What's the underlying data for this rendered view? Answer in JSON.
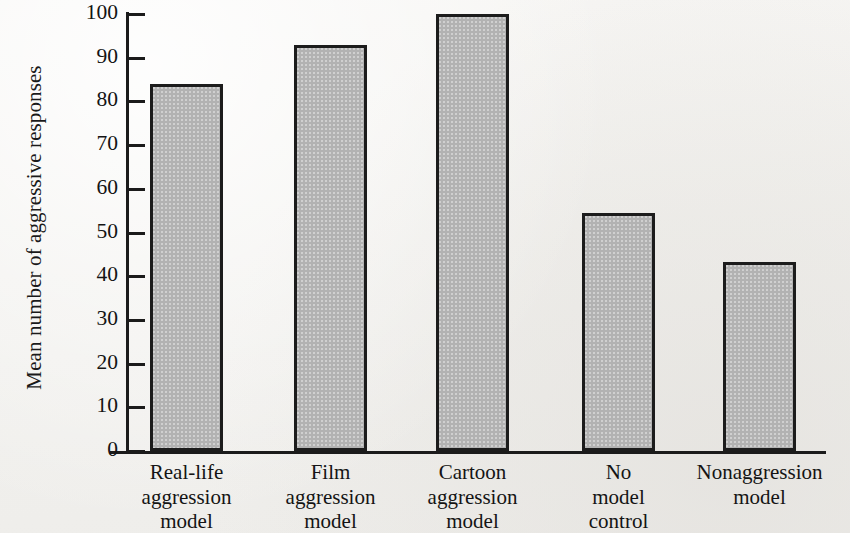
{
  "chart_data": {
    "type": "bar",
    "title": "",
    "xlabel": "",
    "ylabel": "Mean number of aggressive responses",
    "ylim": [
      0,
      100
    ],
    "yticks": [
      0,
      10,
      20,
      30,
      40,
      50,
      60,
      70,
      80,
      90,
      100
    ],
    "ytick_labels": [
      "0",
      "10",
      "20",
      "30",
      "40",
      "50",
      "60",
      "70",
      "80",
      "90",
      "100"
    ],
    "grid": false,
    "legend": false,
    "bar_color": "#b2b2b2",
    "bar_edge_color": "#1c1c1c",
    "axis_color": "#1b1b1b",
    "background_color": "#f4f3f1",
    "categories": [
      "Real-life aggression model",
      "Film aggression model",
      "Cartoon aggression model",
      "No model control",
      "Nonaggression model"
    ],
    "category_lines": [
      [
        "Real-life",
        "aggression",
        "model"
      ],
      [
        "Film",
        "aggression",
        "model"
      ],
      [
        "Cartoon",
        "aggression",
        "model"
      ],
      [
        "No",
        "model",
        "control"
      ],
      [
        "Nonaggression",
        "model"
      ]
    ],
    "values": [
      84,
      93,
      100,
      54.5,
      43.3
    ]
  }
}
